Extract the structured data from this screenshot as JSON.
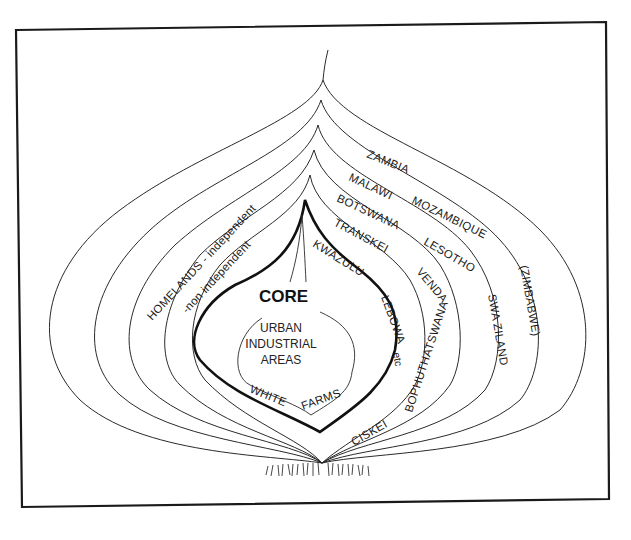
{
  "diagram": {
    "type": "nested-onion-diagram",
    "core": {
      "title": "CORE",
      "inner_lines": [
        "URBAN",
        "INDUSTRIAL",
        "AREAS"
      ],
      "white_farms": [
        "WHITE",
        "FARMS"
      ]
    },
    "homelands": {
      "independent_label": "HOMELANDS - independent",
      "non_independent_label": "-non independent",
      "non_independent": [
        "KWAZULU",
        "LEBOWA",
        "etc"
      ],
      "independent": [
        "TRANSKEI",
        "VENDA",
        "BOPHUTHATSWANA",
        "CISKEI"
      ]
    },
    "layers": [
      {
        "name": "outer",
        "countries": [
          "ZAMBIA",
          "(ZIMBABWE)"
        ]
      },
      {
        "name": "second",
        "countries": [
          "MALAWI",
          "MOZAMBIQUE",
          "SWA ZILAND"
        ]
      },
      {
        "name": "third",
        "countries": [
          "BOTSWANA",
          "LESOTHO"
        ]
      }
    ],
    "colors": {
      "line": "#2a2a2a",
      "core": "#111111",
      "background": "#ffffff"
    }
  }
}
